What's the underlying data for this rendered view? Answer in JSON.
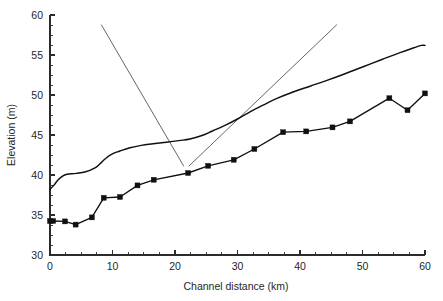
{
  "chart_data": {
    "type": "line",
    "title": "",
    "xlabel": "Channel distance (km)",
    "ylabel": "Elevation (m)",
    "xlim": [
      0,
      60
    ],
    "ylim": [
      30,
      60
    ],
    "x_ticks": [
      0,
      10,
      20,
      30,
      40,
      50,
      60
    ],
    "x_tick_labels": [
      "0",
      "10",
      "20",
      "30",
      "40",
      "50",
      "60"
    ],
    "x_minor_step": 2.5,
    "y_ticks": [
      30,
      35,
      40,
      45,
      50,
      55,
      60
    ],
    "y_tick_labels": [
      "30",
      "35",
      "40",
      "45",
      "50",
      "55",
      "60"
    ],
    "y_minor_step": 1.25,
    "grid": false,
    "legend": "none",
    "series": [
      {
        "name": "Terrace surface profile",
        "style": "smooth-line-no-markers",
        "markers": false,
        "points": [
          [
            0.0,
            38.2
          ],
          [
            0.6,
            38.7
          ],
          [
            1.2,
            39.3
          ],
          [
            1.9,
            39.8
          ],
          [
            2.7,
            40.1
          ],
          [
            4.2,
            40.2
          ],
          [
            5.7,
            40.4
          ],
          [
            7.2,
            40.9
          ],
          [
            8.0,
            41.4
          ],
          [
            8.8,
            42.0
          ],
          [
            9.9,
            42.6
          ],
          [
            11.2,
            43.0
          ],
          [
            12.8,
            43.4
          ],
          [
            14.6,
            43.7
          ],
          [
            16.5,
            43.9
          ],
          [
            18.6,
            44.1
          ],
          [
            20.6,
            44.3
          ],
          [
            22.4,
            44.5
          ],
          [
            24.2,
            44.9
          ],
          [
            26.0,
            45.5
          ],
          [
            28.0,
            46.2
          ],
          [
            30.0,
            47.0
          ],
          [
            32.0,
            47.9
          ],
          [
            34.0,
            48.7
          ],
          [
            36.4,
            49.6
          ],
          [
            39.0,
            50.4
          ],
          [
            41.6,
            51.1
          ],
          [
            44.2,
            51.8
          ],
          [
            47.0,
            52.6
          ],
          [
            50.0,
            53.5
          ],
          [
            53.0,
            54.4
          ],
          [
            56.0,
            55.3
          ],
          [
            58.2,
            55.9
          ],
          [
            59.4,
            56.2
          ],
          [
            60.0,
            56.2
          ]
        ]
      },
      {
        "name": "Channel bed profile",
        "style": "line-with-square-markers",
        "markers": true,
        "marker_shape": "square",
        "points": [
          [
            0.0,
            34.25
          ],
          [
            0.5,
            34.25
          ],
          [
            2.4,
            34.2
          ],
          [
            4.1,
            33.8
          ],
          [
            6.7,
            34.7
          ],
          [
            8.6,
            37.15
          ],
          [
            11.2,
            37.25
          ],
          [
            14.0,
            38.7
          ],
          [
            16.6,
            39.4
          ],
          [
            22.1,
            40.25
          ],
          [
            25.3,
            41.15
          ],
          [
            29.4,
            41.9
          ],
          [
            32.7,
            43.25
          ],
          [
            37.3,
            45.35
          ],
          [
            41.0,
            45.45
          ],
          [
            45.2,
            45.95
          ],
          [
            48.0,
            46.7
          ],
          [
            54.3,
            49.6
          ],
          [
            57.2,
            48.1
          ],
          [
            60.0,
            50.2
          ]
        ]
      }
    ],
    "annotations": [
      {
        "name": "descending-trend-line",
        "type": "straight-line",
        "x0": 8.2,
        "y0": 58.8,
        "x1": 21.4,
        "y1": 41.1
      },
      {
        "name": "ascending-trend-line",
        "type": "straight-line",
        "x0": 22.2,
        "y0": 41.1,
        "x1": 45.9,
        "y1": 58.8
      }
    ]
  },
  "colors": {
    "background": "#ffffff",
    "axis": "#2b2b2b",
    "series_primary": "#101010",
    "trend_line": "#4a4a4a",
    "text": "#262626"
  }
}
